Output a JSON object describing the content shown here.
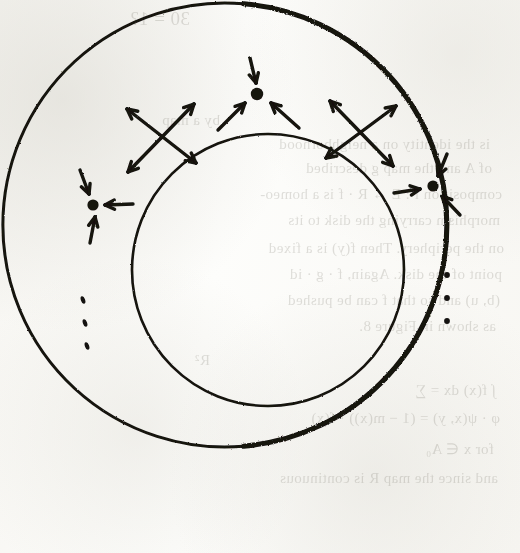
{
  "page": {
    "width": 520,
    "height": 553,
    "background_color": "#fbfbf9",
    "ink_color": "#141210",
    "media": "scanned book page, hand-drawn ink figure"
  },
  "figure": {
    "name": "annulus-phase-portrait",
    "outer_circle": {
      "label": "outer-boundary-circle",
      "center_x": 263,
      "center_y": 225,
      "radius": 222,
      "stroke_width": 3.0,
      "heavy_side": "left"
    },
    "inner_circle": {
      "label": "inner-boundary-circle",
      "center_x": 268,
      "center_y": 270,
      "radius": 136,
      "stroke_width": 2.6
    },
    "fixed_points": [
      {
        "id": "sink-top",
        "type": "sink",
        "label": "attracting fixed point (top)",
        "x": 257,
        "y": 94,
        "dot_radius": 6.2,
        "arrows": [
          {
            "from_x": 250,
            "from_y": 58,
            "to_x": 256,
            "to_y": 83
          },
          {
            "from_x": 218,
            "from_y": 130,
            "to_x": 245,
            "to_y": 103
          },
          {
            "from_x": 299,
            "from_y": 128,
            "to_x": 271,
            "to_y": 103
          }
        ]
      },
      {
        "id": "sink-left",
        "type": "sink",
        "label": "attracting fixed point (left)",
        "x": 93,
        "y": 205,
        "dot_radius": 5.6,
        "arrows": [
          {
            "from_x": 80,
            "from_y": 170,
            "to_x": 89,
            "to_y": 194
          },
          {
            "from_x": 133,
            "from_y": 204,
            "to_x": 105,
            "to_y": 205
          },
          {
            "from_x": 90,
            "from_y": 243,
            "to_x": 95,
            "to_y": 217
          }
        ]
      },
      {
        "id": "sink-right",
        "type": "sink",
        "label": "attracting fixed point (right)",
        "x": 433,
        "y": 186,
        "dot_radius": 5.6,
        "arrows": [
          {
            "from_x": 447,
            "from_y": 154,
            "to_x": 438,
            "to_y": 176
          },
          {
            "from_x": 394,
            "from_y": 193,
            "to_x": 420,
            "to_y": 189
          },
          {
            "from_x": 460,
            "from_y": 215,
            "to_x": 442,
            "to_y": 196
          }
        ]
      }
    ],
    "saddle_points": [
      {
        "id": "saddle-upper-left",
        "type": "saddle",
        "label": "saddle fixed point (upper left)",
        "x": 161,
        "y": 135,
        "unstable_axis": {
          "x1": 127,
          "y1": 109,
          "x2": 196,
          "y2": 163,
          "arrow_ends": "both-outward"
        },
        "stable_axis": {
          "x1": 128,
          "y1": 172,
          "x2": 194,
          "y2": 104,
          "arrow_ends": "both-outward"
        }
      },
      {
        "id": "saddle-upper-right",
        "type": "saddle",
        "label": "saddle fixed point (upper right)",
        "x": 361,
        "y": 132,
        "unstable_axis": {
          "x1": 326,
          "y1": 158,
          "x2": 396,
          "y2": 106,
          "arrow_ends": "both-outward"
        },
        "stable_axis": {
          "x1": 330,
          "y1": 101,
          "x2": 393,
          "y2": 166,
          "arrow_ends": "both-outward"
        }
      }
    ],
    "ellipses": [
      {
        "id": "ellipsis-left",
        "label": "vertical ellipsis (left)",
        "orientation": "vertical",
        "x": 83,
        "y": 300,
        "dot_count": 3,
        "dot_spacing": 23,
        "dot_radius": 2.9,
        "slant": true
      },
      {
        "id": "ellipsis-right",
        "label": "vertical ellipsis (right)",
        "orientation": "vertical",
        "x": 447,
        "y": 275,
        "dot_count": 3,
        "dot_spacing": 23,
        "dot_radius": 2.9,
        "slant": false
      }
    ]
  },
  "bleed_through_text": {
    "note": "faint mirrored show-through of printed text on the reverse of the page",
    "lines": [
      {
        "text": "30 = 1?",
        "x": 330,
        "y": 8,
        "size": 19
      },
      {
        "text": "by a map",
        "x": 300,
        "y": 112,
        "size": 15
      },
      {
        "text": "is the identity on a neighborhood",
        "x": 30,
        "y": 136,
        "size": 15
      },
      {
        "text": "of A and the map g described",
        "x": 28,
        "y": 160,
        "size": 15
      },
      {
        "text": "composition f : E → R · f is a homeo-",
        "x": 18,
        "y": 186,
        "size": 15
      },
      {
        "text": "morphism carrying the disk to its",
        "x": 20,
        "y": 212,
        "size": 15
      },
      {
        "text": "on the periphery. Then f(y) is a fixed",
        "x": 16,
        "y": 240,
        "size": 15
      },
      {
        "text": "point of the disk. Again, f · g · id",
        "x": 18,
        "y": 266,
        "size": 15
      },
      {
        "text": "(b, u) and so that f can be pushed",
        "x": 20,
        "y": 292,
        "size": 15
      },
      {
        "text": "as shown in Figure 8.",
        "x": 24,
        "y": 318,
        "size": 15
      },
      {
        "text": "R²",
        "x": 310,
        "y": 352,
        "size": 15
      },
      {
        "text": "∫ f(x) dx = ∑",
        "x": 24,
        "y": 382,
        "size": 15
      },
      {
        "text": "φ · ψ(x, y) = (1 − m(x)) · f(x)",
        "x": 20,
        "y": 410,
        "size": 15
      },
      {
        "text": "for x ∈ A₀",
        "x": 26,
        "y": 440,
        "size": 15
      },
      {
        "text": "and since the map R is continuous",
        "x": 22,
        "y": 470,
        "size": 15
      }
    ]
  }
}
